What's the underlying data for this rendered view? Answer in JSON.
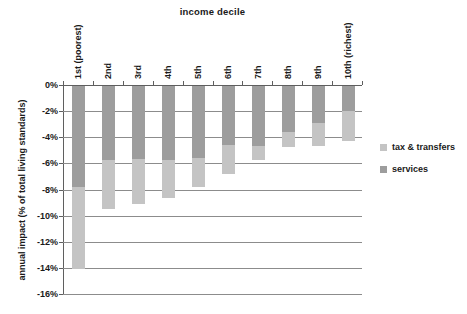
{
  "chart": {
    "title": "income decile",
    "y_axis_title": "annual impact (% of total living standards)",
    "legend_entries": [
      {
        "label": "tax & transfers",
        "color": "#c4c4c4"
      },
      {
        "label": "services",
        "color": "#9d9d9d"
      }
    ]
  },
  "chart_data": {
    "type": "bar",
    "stacked": true,
    "orientation": "vertical-negative",
    "title": "income decile",
    "xlabel": "income decile",
    "ylabel": "annual impact (% of total living standards)",
    "categories": [
      "1st (poorest)",
      "2nd",
      "3rd",
      "4th",
      "5th",
      "6th",
      "7th",
      "8th",
      "9th",
      "10th (richest)"
    ],
    "series": [
      {
        "name": "services",
        "color": "#9d9d9d",
        "values": [
          -7.7,
          -5.7,
          -5.6,
          -5.7,
          -5.5,
          -4.5,
          -4.6,
          -3.5,
          -2.8,
          -1.9
        ]
      },
      {
        "name": "tax & transfers",
        "color": "#c4c4c4",
        "values": [
          -6.3,
          -3.7,
          -3.4,
          -2.9,
          -2.2,
          -2.2,
          -1.1,
          -1.2,
          -1.8,
          -2.3
        ]
      }
    ],
    "stacked_totals": [
      -14.0,
      -9.4,
      -9.0,
      -8.6,
      -7.7,
      -6.7,
      -5.7,
      -4.7,
      -4.6,
      -4.2
    ],
    "ylim": [
      -16,
      0
    ],
    "y_tick_step": 2,
    "y_tick_labels": [
      "0%",
      "-2%",
      "-4%",
      "-6%",
      "-8%",
      "-10%",
      "-12%",
      "-14%",
      "-16%"
    ],
    "grid": true,
    "legend_position": "right"
  }
}
